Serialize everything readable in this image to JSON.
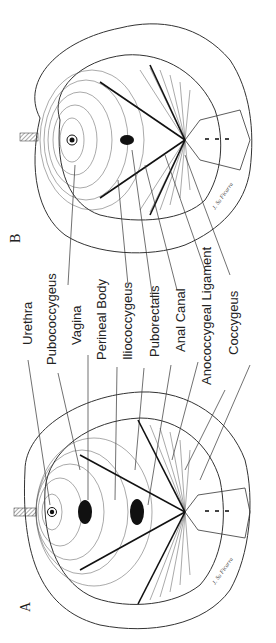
{
  "figure": {
    "panels": [
      {
        "id": "A",
        "label": "A"
      },
      {
        "id": "B",
        "label": "B"
      }
    ],
    "labels": [
      "Urethra",
      "Pubococcygeus",
      "Vagina",
      "Perineal Body",
      "Iliococcygeus",
      "Puborectalis",
      "Anal Canal",
      "Anococcygeal Ligament",
      "Coccygeus"
    ],
    "signature": "J. Su Ficarra",
    "orientation": "rotated 90° counter-clockwise",
    "colors": {
      "ink": "#222222",
      "background": "#ffffff",
      "fill": "#111111"
    }
  }
}
